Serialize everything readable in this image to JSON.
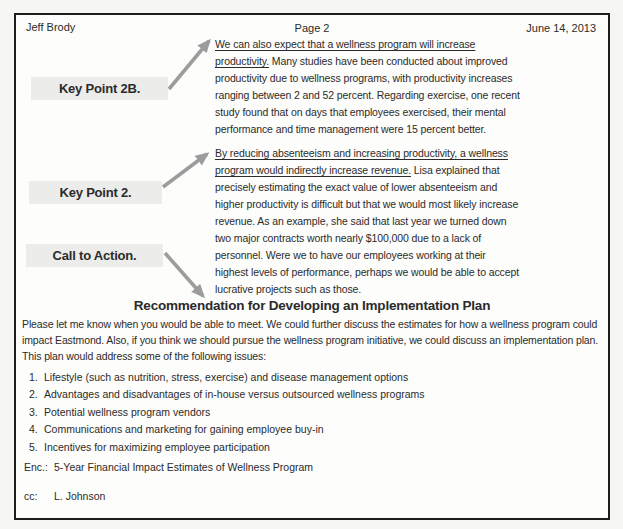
{
  "header": {
    "left": "Jeff Brody",
    "center": "Page 2",
    "right": "June 14, 2013"
  },
  "annotations": [
    {
      "label": "Key Point 2B."
    },
    {
      "label": "Key Point 2."
    },
    {
      "label": "Call to Action."
    }
  ],
  "paragraphs": [
    {
      "underlined": "We can also expect that a wellness program will increase\nproductivity.",
      "rest": " Many studies have been conducted about improved\nproductivity due to wellness programs, with productivity increases\nranging between 2 and 52 percent. Regarding exercise, one recent\nstudy found that on days that employees exercised, their mental\nperformance and time management were 15 percent better."
    },
    {
      "underlined": "By reducing absenteeism and increasing productivity, a wellness\nprogram would indirectly increase revenue.",
      "rest": " Lisa explained that\nprecisely estimating the exact value of lower absenteeism and\nhigher productivity is difficult but that we would most likely increase\nrevenue. As an example, she said that last year we turned down\ntwo major contracts worth nearly $100,000 due to a lack of\npersonnel. Were we to have our employees working at their\nhighest levels of performance, perhaps we would be able to accept\nlucrative projects such as those."
    }
  ],
  "heading": "Recommendation for Developing an Implementation Plan",
  "body_paragraph": "Please let me know when you would be able to meet. We could further discuss the estimates for how a wellness program could\nimpact Eastmond. Also, if you think we should pursue the wellness program initiative, we could discuss an implementation plan.\nThis plan would address some of the following issues:",
  "list": [
    {
      "num": "1.",
      "text": "Lifestyle (such as nutrition, stress, exercise) and disease management options"
    },
    {
      "num": "2.",
      "text": "Advantages and disadvantages of in-house versus outsourced wellness programs"
    },
    {
      "num": "3.",
      "text": "Potential wellness program vendors"
    },
    {
      "num": "4.",
      "text": "Communications and marketing for gaining employee buy-in"
    },
    {
      "num": "5.",
      "text": "Incentives for maximizing employee participation"
    }
  ],
  "enclosure": {
    "label": "Enc.:",
    "text": "5-Year Financial Impact Estimates of Wellness Program"
  },
  "cc": {
    "label": "cc:",
    "text": "L. Johnson"
  },
  "colors": {
    "arrow": "#9c9c9c",
    "callout_bg": "#ececea",
    "border": "#1d1d1d",
    "page_bg": "#fdfdfb",
    "canvas_bg": "#f6f6f4",
    "text": "#2b2b2b"
  }
}
